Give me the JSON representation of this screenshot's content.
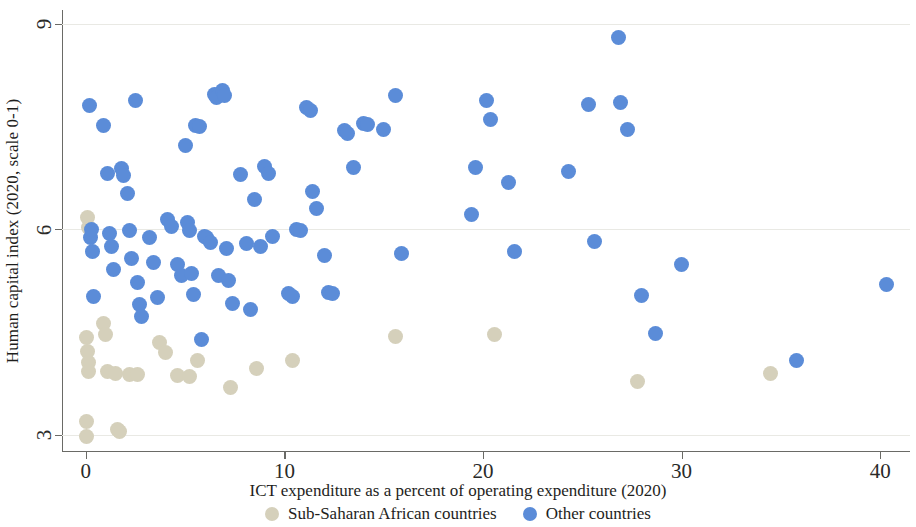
{
  "chart_data": {
    "type": "scatter",
    "title": "",
    "xlabel": "ICT expenditure as a percent of operating expenditure (2020)",
    "ylabel": "Human capital index (2020, scale 0-1)",
    "xlim": [
      -1.2,
      41.5
    ],
    "ylim": [
      2.75,
      9.2
    ],
    "xticks": [
      0,
      10,
      20,
      30,
      40
    ],
    "xtick_labels": [
      "0",
      "10",
      "20",
      "30",
      "40"
    ],
    "yticks": [
      3,
      6,
      9
    ],
    "ytick_labels": [
      "3",
      "6",
      "9"
    ],
    "grid": "horizontal",
    "legend_position": "bottom",
    "colors": {
      "sub_saharan": "#d5d0bb",
      "other": "#5b8cd8",
      "axis": "#6a6a66",
      "gridline": "#e9e9e4",
      "text": "#1e1e1c",
      "background": "#ffffff"
    },
    "series": [
      {
        "name": "Sub-Saharan African countries",
        "key": "sub_saharan",
        "color": "#d5d0bb",
        "points": [
          [
            0.1,
            6.17
          ],
          [
            0.15,
            6.02
          ],
          [
            0.05,
            4.42
          ],
          [
            0.1,
            4.22
          ],
          [
            0.12,
            4.06
          ],
          [
            0.15,
            3.93
          ],
          [
            0.05,
            3.2
          ],
          [
            0.05,
            2.97
          ],
          [
            0.9,
            4.62
          ],
          [
            1.0,
            4.47
          ],
          [
            1.1,
            3.92
          ],
          [
            1.5,
            3.9
          ],
          [
            1.6,
            3.08
          ],
          [
            1.7,
            3.05
          ],
          [
            2.2,
            3.88
          ],
          [
            2.6,
            3.88
          ],
          [
            3.7,
            4.35
          ],
          [
            4.0,
            4.2
          ],
          [
            4.6,
            3.87
          ],
          [
            5.2,
            3.85
          ],
          [
            5.6,
            4.08
          ],
          [
            7.3,
            3.69
          ],
          [
            8.6,
            3.97
          ],
          [
            10.4,
            4.08
          ],
          [
            15.6,
            4.44
          ],
          [
            20.6,
            4.46
          ],
          [
            27.8,
            3.78
          ],
          [
            34.5,
            3.9
          ]
        ]
      },
      {
        "name": "Other countries",
        "key": "other",
        "color": "#5b8cd8",
        "points": [
          [
            0.2,
            7.8
          ],
          [
            0.25,
            5.88
          ],
          [
            0.3,
            6.0
          ],
          [
            0.35,
            5.67
          ],
          [
            0.4,
            5.02
          ],
          [
            0.9,
            7.52
          ],
          [
            1.1,
            6.82
          ],
          [
            1.2,
            5.94
          ],
          [
            1.3,
            5.75
          ],
          [
            1.4,
            5.42
          ],
          [
            1.8,
            6.88
          ],
          [
            1.9,
            6.78
          ],
          [
            2.1,
            6.52
          ],
          [
            2.2,
            5.98
          ],
          [
            2.3,
            5.58
          ],
          [
            2.5,
            7.88
          ],
          [
            2.6,
            5.22
          ],
          [
            2.7,
            4.9
          ],
          [
            2.8,
            4.73
          ],
          [
            3.2,
            5.88
          ],
          [
            3.4,
            5.52
          ],
          [
            3.6,
            5.0
          ],
          [
            4.1,
            6.14
          ],
          [
            4.3,
            6.04
          ],
          [
            4.6,
            5.48
          ],
          [
            4.8,
            5.32
          ],
          [
            5.0,
            7.22
          ],
          [
            5.1,
            6.1
          ],
          [
            5.2,
            5.98
          ],
          [
            5.3,
            5.35
          ],
          [
            5.4,
            5.05
          ],
          [
            5.5,
            7.52
          ],
          [
            5.7,
            7.5
          ],
          [
            5.8,
            4.39
          ],
          [
            6.0,
            5.9
          ],
          [
            6.1,
            5.88
          ],
          [
            6.3,
            5.8
          ],
          [
            6.5,
            7.97
          ],
          [
            6.6,
            7.92
          ],
          [
            6.7,
            5.32
          ],
          [
            6.9,
            8.03
          ],
          [
            7.0,
            7.95
          ],
          [
            7.1,
            5.72
          ],
          [
            7.2,
            5.25
          ],
          [
            7.4,
            4.92
          ],
          [
            7.8,
            6.8
          ],
          [
            8.1,
            5.79
          ],
          [
            8.3,
            4.83
          ],
          [
            8.5,
            6.43
          ],
          [
            8.8,
            5.75
          ],
          [
            9.0,
            6.92
          ],
          [
            9.2,
            6.81
          ],
          [
            9.4,
            5.9
          ],
          [
            10.2,
            5.06
          ],
          [
            10.4,
            5.02
          ],
          [
            10.6,
            6.0
          ],
          [
            10.8,
            5.98
          ],
          [
            11.1,
            7.78
          ],
          [
            11.3,
            7.74
          ],
          [
            11.4,
            6.55
          ],
          [
            11.6,
            6.3
          ],
          [
            12.0,
            5.62
          ],
          [
            12.2,
            5.08
          ],
          [
            12.4,
            5.06
          ],
          [
            13.0,
            7.44
          ],
          [
            13.2,
            7.4
          ],
          [
            13.5,
            6.9
          ],
          [
            14.0,
            7.55
          ],
          [
            14.2,
            7.53
          ],
          [
            15.0,
            7.45
          ],
          [
            15.6,
            7.95
          ],
          [
            15.9,
            5.65
          ],
          [
            19.4,
            6.22
          ],
          [
            19.6,
            6.9
          ],
          [
            20.2,
            7.88
          ],
          [
            20.4,
            7.6
          ],
          [
            21.3,
            6.68
          ],
          [
            21.6,
            5.68
          ],
          [
            24.3,
            6.85
          ],
          [
            25.3,
            7.82
          ],
          [
            25.6,
            5.82
          ],
          [
            26.8,
            8.8
          ],
          [
            26.9,
            7.85
          ],
          [
            27.3,
            7.45
          ],
          [
            28.0,
            5.03
          ],
          [
            28.7,
            4.48
          ],
          [
            30.0,
            5.48
          ],
          [
            35.8,
            4.08
          ],
          [
            40.3,
            5.2
          ]
        ]
      }
    ]
  },
  "axes": {
    "y_title": "Human capital index (2020, scale 0-1)",
    "x_title": "ICT expenditure as a percent of operating expenditure (2020)"
  },
  "legend": {
    "items": [
      {
        "label": "Sub-Saharan African countries",
        "key": "ssa"
      },
      {
        "label": "Other countries",
        "key": "other"
      }
    ]
  }
}
